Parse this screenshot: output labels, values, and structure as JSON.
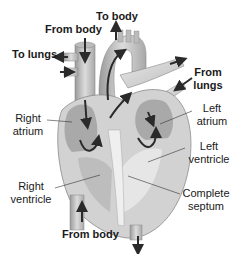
{
  "diagram": {
    "flow_labels": {
      "to_body": "To body",
      "from_body_top": "From body",
      "to_lungs": "To lungs",
      "from_lungs_line1": "From",
      "from_lungs_line2": "lungs",
      "from_body_bottom": "From body"
    },
    "part_labels": {
      "right_atrium_line1": "Right",
      "right_atrium_line2": "atrium",
      "left_atrium_line1": "Left",
      "left_atrium_line2": "atrium",
      "left_ventricle_line1": "Left",
      "left_ventricle_line2": "ventricle",
      "right_ventricle_line1": "Right",
      "right_ventricle_line2": "ventricle",
      "complete_septum_line1": "Complete",
      "complete_septum_line2": "septum"
    },
    "colors": {
      "heart_fill": "#c8c8c8",
      "heart_light": "#e4e4e4",
      "heart_dark": "#8a8a8a",
      "arrow": "#2a2a2a",
      "text": "#1a1a1a"
    }
  }
}
